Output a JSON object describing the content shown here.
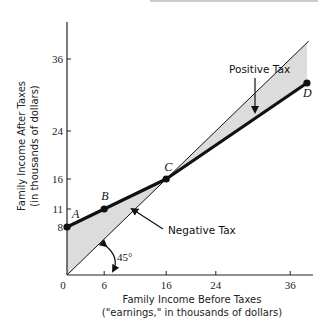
{
  "chart_data": {
    "type": "line",
    "title": "",
    "xlabel": [
      "Family Income Before Taxes",
      "(\"earnings,\" in thousands of dollars)"
    ],
    "ylabel": [
      "Family Income After Taxes",
      "(in thousands of dollars)"
    ],
    "xlim": [
      0,
      40
    ],
    "ylim": [
      0,
      40
    ],
    "x_ticks": [
      0,
      6,
      16,
      24,
      36
    ],
    "x_tick_labels": [
      "0",
      "6",
      "16",
      "24",
      "36"
    ],
    "y_ticks": [
      8,
      11,
      16,
      24,
      36
    ],
    "y_tick_labels": [
      "8",
      "11",
      "16",
      "24",
      "36"
    ],
    "grid": false,
    "series": [
      {
        "name": "45-degree line (no tax)",
        "style": "thin",
        "points": [
          [
            0,
            0
          ],
          [
            39,
            39
          ]
        ]
      },
      {
        "name": "Negative income tax schedule",
        "style": "thick",
        "points": [
          [
            0,
            8
          ],
          [
            6,
            11
          ],
          [
            16,
            16
          ],
          [
            38.7,
            32
          ]
        ]
      }
    ],
    "labeled_points": [
      {
        "label": "A",
        "x": 0,
        "y": 8
      },
      {
        "label": "B",
        "x": 6,
        "y": 11
      },
      {
        "label": "C",
        "x": 16,
        "y": 16
      },
      {
        "label": "D",
        "x": 38.7,
        "y": 32
      }
    ],
    "shaded_regions": [
      {
        "name": "Negative Tax",
        "from_x": 0,
        "to_x": 16,
        "color": "#dcdcdc"
      },
      {
        "name": "Positive Tax",
        "from_x": 16,
        "to_x": 38.7,
        "color": "#dcdcdc"
      }
    ],
    "annotations": [
      {
        "text": "Positive Tax",
        "points_to": "positive-tax-region"
      },
      {
        "text": "Negative Tax",
        "points_to": "negative-tax-region"
      },
      {
        "text": "45°",
        "points_to": "angle-45"
      }
    ],
    "colors": {
      "line": "#111111",
      "shade": "#dcdcdc",
      "axis": "#222222"
    }
  }
}
